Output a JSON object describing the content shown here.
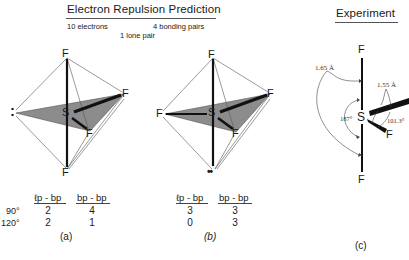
{
  "header": {
    "prediction_title": "Electron Repulsion Prediction",
    "electrons": "10 electrons",
    "bonding_pairs": "4 bonding pairs",
    "lone_pairs": "1 lone pair",
    "experiment_title": "Experiment"
  },
  "structures": {
    "a": {
      "caption": "(a)",
      "atoms": {
        "center": "S",
        "top": "F",
        "bottom": "F",
        "right": "F",
        "front": "F",
        "lone_pair": ":"
      },
      "table": {
        "col1": "ℓp - bp",
        "col2": "bp - bp",
        "rows": [
          {
            "angle": "90°",
            "lp_bp": "2",
            "bp_bp": "4"
          },
          {
            "angle": "120°",
            "lp_bp": "2",
            "bp_bp": "1"
          }
        ]
      }
    },
    "b": {
      "caption": "(b)",
      "atoms": {
        "center": "S",
        "top": "F",
        "left": "F",
        "right": "F",
        "front": "F",
        "lone_pair": "••"
      },
      "table": {
        "col1": "ℓp - bp",
        "col2": "bp - bp",
        "rows": [
          {
            "lp_bp": "3",
            "bp_bp": "3"
          },
          {
            "lp_bp": "0",
            "bp_bp": "3"
          }
        ]
      }
    },
    "c": {
      "caption": "(c)",
      "atoms": {
        "center": "S",
        "top": "F",
        "bottom": "F",
        "front": "F"
      },
      "annotations": {
        "axial_length": "1.65 Å",
        "equatorial_length": "1.55 Å",
        "axial_angle": "187°",
        "equatorial_angle": "101.3°"
      }
    }
  },
  "colors": {
    "shade": "#8c8c8c",
    "line": "#111111",
    "thin": "#555555"
  }
}
